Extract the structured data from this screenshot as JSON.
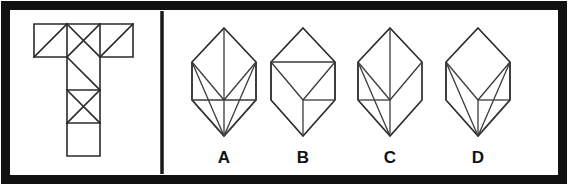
{
  "figure": {
    "type": "spatial-reasoning-puzzle",
    "colors": {
      "background": "#ffffff",
      "ink": "#2b2b2b",
      "frame": "#111111",
      "divider": "#1a1a1a"
    },
    "frame": {
      "outer_stroke_width": 9,
      "divider_x": 162
    }
  },
  "question_panel": {
    "name": "t-shaped-net",
    "cell_size": 33,
    "grid_origin": {
      "x": 34,
      "y": 24
    },
    "cells": [
      {
        "id": "top-left",
        "col": 0,
        "row": 0,
        "diagonals": [
          "tl-br"
        ]
      },
      {
        "id": "top-middle",
        "col": 1,
        "row": 0,
        "diagonals": [
          "tl-br",
          "tr-bl"
        ]
      },
      {
        "id": "top-right",
        "col": 2,
        "row": 0,
        "diagonals": [
          "tr-bl"
        ]
      },
      {
        "id": "stem-1",
        "col": 1,
        "row": 1,
        "diagonals": [
          "tl-br"
        ]
      },
      {
        "id": "stem-2",
        "col": 1,
        "row": 2,
        "diagonals": [
          "tl-br",
          "tr-bl"
        ]
      },
      {
        "id": "stem-3",
        "col": 1,
        "row": 3,
        "diagonals": []
      }
    ],
    "total_cells": 6,
    "shape_letter": "T"
  },
  "answer_panel": {
    "name": "answer-options",
    "options": [
      {
        "key": "A",
        "label": "A",
        "center_x": 224,
        "label_x": 224,
        "label_y": 159,
        "shape": "elongated-hexagon-fan",
        "internal_edge_count": 9,
        "description": "Hexagonal solid with a full fan of edges radiating to the bottom apex and to the centre point."
      },
      {
        "key": "B",
        "label": "B",
        "center_x": 303,
        "label_x": 303,
        "label_y": 159,
        "shape": "hexagon-cube-like",
        "internal_edge_count": 5,
        "description": "Hexagonal solid drawn like a cube corner with a single horizontal band and few internal edges."
      },
      {
        "key": "C",
        "label": "C",
        "center_x": 390,
        "label_x": 390,
        "label_y": 159,
        "shape": "hexagon-left-fan",
        "internal_edge_count": 7,
        "description": "Hexagonal solid with a vertical spine and a fan of edges opening from the upper-left vertex."
      },
      {
        "key": "D",
        "label": "D",
        "center_x": 478,
        "label_x": 478,
        "label_y": 159,
        "shape": "hexagon-right-fan",
        "internal_edge_count": 8,
        "description": "Hexagonal solid with a cube-like top and a fan of edges converging on the bottom apex from the right."
      }
    ],
    "option_count": 4
  }
}
